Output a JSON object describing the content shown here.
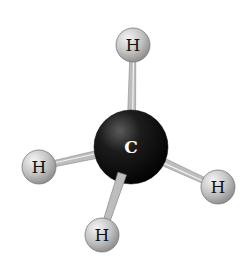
{
  "diagram": {
    "type": "ball-and-stick molecular model",
    "molecule": "methane",
    "atoms": [
      {
        "id": "C",
        "label": "C",
        "cx": 131,
        "cy": 147,
        "r": 37,
        "color": "#111111",
        "text_color": "#ffffff"
      },
      {
        "id": "H_top",
        "label": "H",
        "cx": 133,
        "cy": 45,
        "r": 17,
        "color": "#c8c8c8",
        "text_color": "#111111"
      },
      {
        "id": "H_left",
        "label": "H",
        "cx": 39,
        "cy": 167,
        "r": 17,
        "color": "#c8c8c8",
        "text_color": "#111111"
      },
      {
        "id": "H_right",
        "label": "H",
        "cx": 218,
        "cy": 187,
        "r": 17,
        "color": "#c8c8c8",
        "text_color": "#111111"
      },
      {
        "id": "H_bottom",
        "label": "H",
        "cx": 102,
        "cy": 235,
        "r": 17,
        "color": "#c8c8c8",
        "text_color": "#111111"
      }
    ],
    "bonds": [
      {
        "from": "C",
        "to": "H_top"
      },
      {
        "from": "C",
        "to": "H_left"
      },
      {
        "from": "C",
        "to": "H_right"
      },
      {
        "from": "C",
        "to": "H_bottom"
      }
    ],
    "bond_color": "#bdbdbd"
  }
}
